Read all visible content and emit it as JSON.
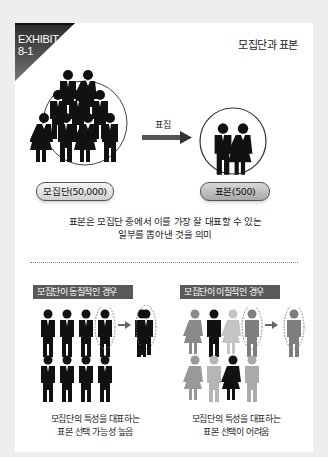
{
  "exhibit": {
    "label": "EXHIBIT",
    "number": "8-1"
  },
  "title": "모집단과 표본",
  "top": {
    "arrow_label": "표집",
    "population_label": "모집단(50,000)",
    "sample_label": "표본(500)",
    "description_line1": "표본은 모집단 중에서 이를 가장 잘 대표할 수 있는",
    "description_line2": "일부를 뽑아낸 것을 의미"
  },
  "bottom": {
    "left": {
      "badge": "모집단이 동질적인 경우",
      "caption_line1": "모집단의 특성을 대표하는",
      "caption_line2": "표본 선택 가능성 높음",
      "figure_colors": [
        "#111111",
        "#111111",
        "#111111",
        "#111111",
        "#111111",
        "#111111",
        "#111111",
        "#111111"
      ],
      "selected_color": "#111111"
    },
    "right": {
      "badge": "모집단이 이질적인 경우",
      "caption_line1": "모집단의 특성을 대표하는",
      "caption_line2": "표본 선택이 어려움",
      "figure_colors": [
        "#8a8a8a",
        "#111111",
        "#c4c4c4",
        "#7e7e7e",
        "#999999",
        "#b6b6b6",
        "#111111",
        "#aaaaaa"
      ],
      "selected_color": "#7e7e7e"
    }
  },
  "colors": {
    "background": "#eeeeee",
    "card": "#ffffff",
    "badge": "#5a5a5a",
    "text": "#222222"
  }
}
